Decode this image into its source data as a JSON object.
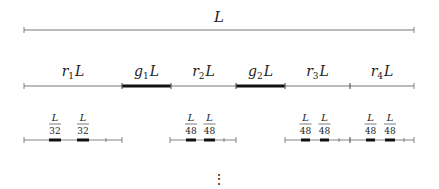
{
  "title_label": "L",
  "row1": {
    "label": "L",
    "start": 24,
    "end": 414,
    "y": 30
  },
  "row2": {
    "y": 86,
    "start": 24,
    "end": 414,
    "segments": [
      {
        "label": "r1L",
        "base": "r",
        "sub": "1",
        "tail": "L",
        "x1": 24,
        "x2": 122,
        "thick": false
      },
      {
        "label": "g1L",
        "base": "g",
        "sub": "1",
        "tail": "L",
        "x1": 122,
        "x2": 171,
        "thick": true
      },
      {
        "label": "r2L",
        "base": "r",
        "sub": "2",
        "tail": "L",
        "x1": 171,
        "x2": 236,
        "thick": false
      },
      {
        "label": "g2L",
        "base": "g",
        "sub": "2",
        "tail": "L",
        "x1": 236,
        "x2": 285,
        "thick": true
      },
      {
        "label": "r3L",
        "base": "r",
        "sub": "3",
        "tail": "L",
        "x1": 285,
        "x2": 350,
        "thick": false
      },
      {
        "label": "r4L",
        "base": "r",
        "sub": "4",
        "tail": "L",
        "x1": 350,
        "x2": 414,
        "thick": false
      }
    ]
  },
  "row3": {
    "y": 140,
    "groups": [
      {
        "start": 24,
        "end": 122,
        "tick": 106,
        "gaps": [
          {
            "x1": 49,
            "x2": 61,
            "num": "L",
            "den": "32"
          },
          {
            "x1": 77,
            "x2": 89,
            "num": "L",
            "den": "32"
          }
        ]
      },
      {
        "start": 170,
        "end": 236,
        "tick": 224,
        "gaps": [
          {
            "x1": 186,
            "x2": 196,
            "num": "L",
            "den": "48"
          },
          {
            "x1": 204,
            "x2": 215,
            "num": "L",
            "den": "48"
          }
        ]
      },
      {
        "start": 285,
        "end": 350,
        "tick": 339,
        "gaps": [
          {
            "x1": 301,
            "x2": 310,
            "num": "L",
            "den": "48"
          },
          {
            "x1": 320,
            "x2": 329,
            "num": "L",
            "den": "48"
          }
        ]
      },
      {
        "start": 350,
        "end": 414,
        "tick": 404,
        "gaps": [
          {
            "x1": 366,
            "x2": 375,
            "num": "L",
            "den": "48"
          },
          {
            "x1": 385,
            "x2": 395,
            "num": "L",
            "den": "48"
          }
        ]
      }
    ]
  },
  "continuation": "⋮"
}
